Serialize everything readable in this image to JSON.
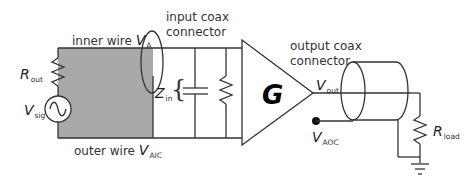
{
  "diagram": {
    "type": "circuit-schematic",
    "labels": {
      "input_connector": [
        "input coax",
        "connector"
      ],
      "output_connector": [
        "output coax",
        "connector"
      ],
      "inner_wire": "inner wire ",
      "inner_wire_var": "V",
      "inner_wire_sub": "A",
      "outer_wire": "outer wire ",
      "outer_wire_var": "V",
      "outer_wire_sub": "AIC",
      "r_out": "R",
      "r_out_sub": "out",
      "v_sig": "V",
      "v_sig_sub": "sig",
      "z_in": "Z",
      "z_in_sub": "in",
      "gain": "G",
      "v_out": "V",
      "v_out_sub": "out",
      "v_aoc": "V",
      "v_aoc_sub": "AOC",
      "r_load": "R",
      "r_load_sub": "load"
    },
    "components": [
      "signal source V_sig",
      "source resistor R_out",
      "input coax connector",
      "input capacitor",
      "input resistor",
      "amplifier G",
      "output coax connector",
      "load resistor R_load",
      "ground"
    ],
    "colors": {
      "wire": "#333333",
      "shield_fill": "#a9a9a9",
      "background": "#ffffff"
    }
  }
}
